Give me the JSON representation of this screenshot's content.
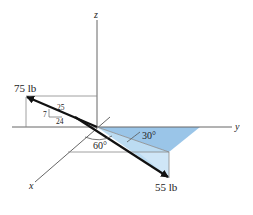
{
  "diagram": {
    "axes": {
      "x": "x",
      "y": "y",
      "z": "z"
    },
    "forces": [
      {
        "label": "75 lb",
        "slope": {
          "hyp": "25",
          "rise": "7",
          "run": "24"
        }
      },
      {
        "label": "55 lb",
        "angles": [
          "60°",
          "30°"
        ]
      }
    ],
    "colors": {
      "plane_dark": "#8fbfe6",
      "plane_light": "#bcdcf2",
      "line": "#555555",
      "vector": "#111111"
    }
  }
}
